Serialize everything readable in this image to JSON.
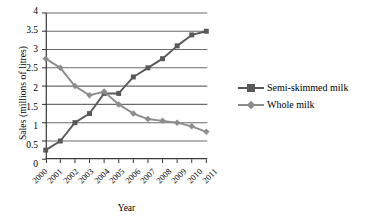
{
  "chart_data": {
    "type": "line",
    "title": "",
    "xlabel": "Year",
    "ylabel": "Sales (millions of litres)",
    "categories": [
      "2000",
      "2001",
      "2002",
      "2003",
      "2004",
      "2005",
      "2006",
      "2007",
      "2008",
      "2009",
      "2010",
      "2011"
    ],
    "x": [
      2000,
      2001,
      2002,
      2003,
      2004,
      2005,
      2006,
      2007,
      2008,
      2009,
      2010,
      2011
    ],
    "ylim": [
      0,
      4
    ],
    "yticks": [
      0,
      0.5,
      1,
      1.5,
      2,
      2.5,
      3,
      3.5,
      4
    ],
    "ytick_labels": [
      "0",
      "0.5",
      "1",
      "1.5",
      "2",
      "2.5",
      "3",
      "3.5",
      "4"
    ],
    "grid": "horizontal",
    "legend_position": "right",
    "series": [
      {
        "name": "Semi-skimmed milk",
        "marker": "square",
        "color": "#595959",
        "values": [
          0.25,
          0.5,
          1.0,
          1.25,
          1.8,
          1.8,
          2.25,
          2.5,
          2.75,
          3.1,
          3.4,
          3.5
        ]
      },
      {
        "name": "Whole milk",
        "marker": "diamond",
        "color": "#8c8c8c",
        "values": [
          2.75,
          2.5,
          2.0,
          1.75,
          1.85,
          1.5,
          1.25,
          1.1,
          1.05,
          1.0,
          0.9,
          0.75
        ]
      }
    ]
  },
  "legend": {
    "items": [
      {
        "label": "Semi-skimmed milk"
      },
      {
        "label": "Whole milk"
      }
    ]
  },
  "colors": {
    "series_semi_skimmed": "#595959",
    "series_whole": "#8c8c8c",
    "axis": "#3b3b3b",
    "gridline": "#6b6b6b",
    "background": "#ffffff"
  }
}
